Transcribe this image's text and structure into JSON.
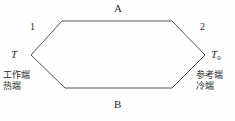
{
  "figure": {
    "kind": "thermocouple-circuit-diagram",
    "background_color": "#fefefe",
    "line_color": "#55555a",
    "text_color": "#2b2b2b"
  },
  "conductors": {
    "upper_label": "A",
    "lower_label": "B"
  },
  "junctions": {
    "left_number": "1",
    "right_number": "2"
  },
  "temperatures": {
    "left_symbol": "T",
    "right_symbol": "T",
    "right_subscript": "0"
  },
  "ends": {
    "hot": {
      "line1": "工作端",
      "line2": "热端"
    },
    "cold": {
      "line1": "参考端",
      "line2": "冷端"
    }
  },
  "geometry": {
    "left_apex": [
      31,
      55
    ],
    "top_left": [
      62,
      21
    ],
    "top_right": [
      172,
      21
    ],
    "right_apex": [
      205,
      55
    ],
    "bottom_right": [
      172,
      88
    ],
    "bottom_left": [
      65,
      88
    ],
    "stroke_width": 1
  }
}
